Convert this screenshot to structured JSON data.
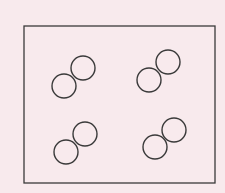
{
  "diagram": {
    "background": "#f8eaed",
    "stroke": "#3a3a3a",
    "container": {
      "x": 24,
      "y": 26,
      "width": 191,
      "height": 157
    },
    "molecules": [
      {
        "atoms": [
          {
            "cx": 64,
            "cy": 86,
            "r": 12
          },
          {
            "cx": 83,
            "cy": 68,
            "r": 12
          }
        ]
      },
      {
        "atoms": [
          {
            "cx": 149,
            "cy": 80,
            "r": 12
          },
          {
            "cx": 168,
            "cy": 62,
            "r": 12
          }
        ]
      },
      {
        "atoms": [
          {
            "cx": 66,
            "cy": 152,
            "r": 12
          },
          {
            "cx": 85,
            "cy": 134,
            "r": 12
          }
        ]
      },
      {
        "atoms": [
          {
            "cx": 155,
            "cy": 147,
            "r": 12
          },
          {
            "cx": 174,
            "cy": 130,
            "r": 12
          }
        ]
      }
    ]
  }
}
